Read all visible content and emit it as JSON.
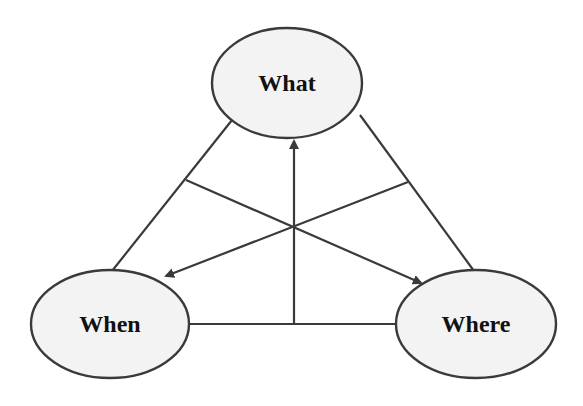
{
  "diagram": {
    "type": "triangle-concept-diagram",
    "nodes": [
      {
        "id": "what",
        "label": "What",
        "cx": 287,
        "cy": 83,
        "rx": 75,
        "ry": 55
      },
      {
        "id": "when",
        "label": "When",
        "cx": 110,
        "cy": 324,
        "rx": 79,
        "ry": 54
      },
      {
        "id": "where",
        "label": "Where",
        "cx": 476,
        "cy": 324,
        "rx": 80,
        "ry": 54
      }
    ],
    "edges": [
      {
        "from": "what",
        "to": "when",
        "kind": "line"
      },
      {
        "from": "what",
        "to": "where",
        "kind": "line"
      },
      {
        "from": "when",
        "to": "where",
        "kind": "line"
      },
      {
        "from": "when-where-midpoint",
        "to": "what",
        "kind": "arrow"
      },
      {
        "from": "what-where-side",
        "to": "when",
        "kind": "arrow"
      },
      {
        "from": "what-when-side",
        "to": "where",
        "kind": "arrow"
      }
    ],
    "colors": {
      "stroke": "#3a3a3a",
      "node_fill": "#f3f3f3",
      "text": "#111111",
      "background": "#ffffff"
    }
  }
}
